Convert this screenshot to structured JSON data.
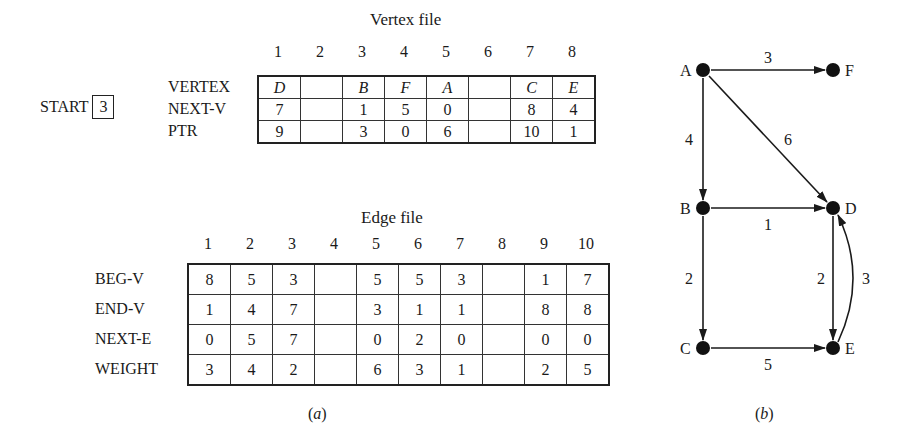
{
  "vertex_file": {
    "title": "Vertex file",
    "indices": [
      "1",
      "2",
      "3",
      "4",
      "5",
      "6",
      "7",
      "8"
    ],
    "start_label": "START",
    "start_value": "3",
    "rows": [
      {
        "label": "VERTEX",
        "cells": [
          "D",
          "",
          "B",
          "F",
          "A",
          "",
          "C",
          "E"
        ]
      },
      {
        "label": "NEXT-V",
        "cells": [
          "7",
          "",
          "1",
          "5",
          "0",
          "",
          "8",
          "4"
        ]
      },
      {
        "label": "PTR",
        "cells": [
          "9",
          "",
          "3",
          "0",
          "6",
          "",
          "10",
          "1"
        ]
      }
    ]
  },
  "edge_file": {
    "title": "Edge file",
    "indices": [
      "1",
      "2",
      "3",
      "4",
      "5",
      "6",
      "7",
      "8",
      "9",
      "10"
    ],
    "rows": [
      {
        "label": "BEG-V",
        "cells": [
          "8",
          "5",
          "3",
          "",
          "5",
          "5",
          "3",
          "",
          "1",
          "7"
        ]
      },
      {
        "label": "END-V",
        "cells": [
          "1",
          "4",
          "7",
          "",
          "3",
          "1",
          "1",
          "",
          "8",
          "8"
        ]
      },
      {
        "label": "NEXT-E",
        "cells": [
          "0",
          "5",
          "7",
          "",
          "0",
          "2",
          "0",
          "",
          "0",
          "0"
        ]
      },
      {
        "label": "WEIGHT",
        "cells": [
          "3",
          "4",
          "2",
          "",
          "6",
          "3",
          "1",
          "",
          "2",
          "5"
        ]
      }
    ]
  },
  "graph": {
    "nodes": [
      {
        "id": "A",
        "x": 703,
        "y": 70
      },
      {
        "id": "F",
        "x": 833,
        "y": 70
      },
      {
        "id": "B",
        "x": 703,
        "y": 208
      },
      {
        "id": "D",
        "x": 833,
        "y": 208
      },
      {
        "id": "C",
        "x": 703,
        "y": 348
      },
      {
        "id": "E",
        "x": 833,
        "y": 348
      }
    ],
    "edges": [
      {
        "from": "A",
        "to": "F",
        "weight": "3"
      },
      {
        "from": "A",
        "to": "B",
        "weight": "4"
      },
      {
        "from": "A",
        "to": "D",
        "weight": "6"
      },
      {
        "from": "B",
        "to": "D",
        "weight": "1"
      },
      {
        "from": "B",
        "to": "C",
        "weight": "2"
      },
      {
        "from": "D",
        "to": "E",
        "weight": "2"
      },
      {
        "from": "E",
        "to": "D",
        "weight": "3"
      },
      {
        "from": "C",
        "to": "E",
        "weight": "5"
      }
    ]
  },
  "captions": {
    "a": "a",
    "b": "b"
  }
}
